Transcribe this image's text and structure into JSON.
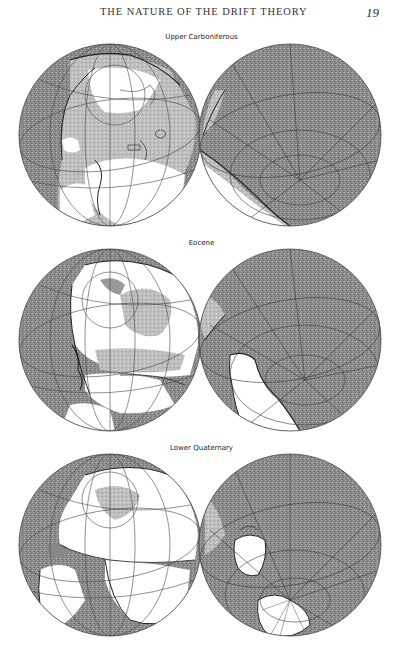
{
  "page": {
    "running_title": "THE NATURE OF THE DRIFT THEORY",
    "page_number": "19"
  },
  "figures": [
    {
      "label": "Upper Carboniferous",
      "globes": [
        "western-hemisphere",
        "eastern-hemisphere"
      ]
    },
    {
      "label": "Eocene",
      "globes": [
        "western-hemisphere",
        "eastern-hemisphere"
      ]
    },
    {
      "label": "Lower Quaternary",
      "globes": [
        "western-hemisphere",
        "eastern-hemisphere"
      ]
    }
  ],
  "colors": {
    "ocean": "#8c8c8c",
    "shallow_sea": "#b5b5b5",
    "land": "#ffffff",
    "outline": "#333333",
    "graticule": "#4a4a4a"
  }
}
